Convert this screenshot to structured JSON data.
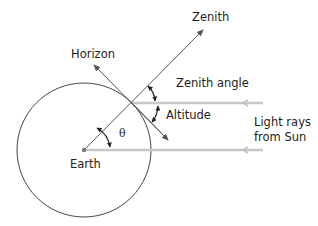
{
  "diagram": {
    "labels": {
      "zenith": "Zenith",
      "horizon": "Horizon",
      "zenith_angle": "Zenith angle",
      "altitude": "Altitude",
      "theta": "θ",
      "earth": "Earth",
      "light_rays_line1": "Light rays",
      "light_rays_line2": "from Sun"
    },
    "colors": {
      "line": "#444444",
      "light_ray": "#c8c8c8",
      "text": "#222222"
    }
  }
}
